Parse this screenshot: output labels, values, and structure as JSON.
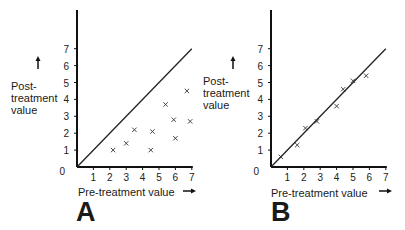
{
  "chart_data": [
    {
      "type": "scatter",
      "panel_label": "A",
      "title": "",
      "xlabel": "Pre-treatment value",
      "ylabel": "Post-treatment value",
      "xlim": [
        0,
        7
      ],
      "ylim": [
        0,
        7
      ],
      "x_ticks": [
        1,
        2,
        3,
        4,
        5,
        6,
        7
      ],
      "y_ticks": [
        0,
        1,
        2,
        3,
        4,
        5,
        6,
        7
      ],
      "grid": false,
      "reference_line": {
        "label": "line of identity",
        "from": [
          0,
          0
        ],
        "to": [
          7,
          7
        ]
      },
      "series": [
        {
          "name": "patients",
          "marker": "x",
          "x": [
            2.2,
            3.0,
            3.5,
            4.5,
            4.6,
            5.4,
            5.9,
            6.0,
            6.7,
            6.9
          ],
          "y": [
            1.0,
            1.4,
            2.2,
            1.0,
            2.1,
            3.7,
            2.8,
            1.7,
            4.5,
            2.7
          ]
        }
      ]
    },
    {
      "type": "scatter",
      "panel_label": "B",
      "title": "",
      "xlabel": "Pre-treatment value",
      "ylabel": "Post-treatment value",
      "xlim": [
        0,
        7
      ],
      "ylim": [
        0,
        7
      ],
      "x_ticks": [
        1,
        2,
        3,
        4,
        5,
        6,
        7
      ],
      "y_ticks": [
        0,
        1,
        2,
        3,
        4,
        5,
        6,
        7
      ],
      "grid": false,
      "reference_line": {
        "label": "line of identity",
        "from": [
          0,
          0
        ],
        "to": [
          7,
          7
        ]
      },
      "series": [
        {
          "name": "patients",
          "marker": "x",
          "x": [
            0.6,
            1.6,
            2.1,
            2.8,
            4.0,
            4.4,
            5.0,
            5.8
          ],
          "y": [
            0.6,
            1.3,
            2.3,
            2.7,
            3.6,
            4.6,
            5.1,
            5.4
          ]
        }
      ]
    }
  ],
  "panels": {
    "A": {
      "letter": "A",
      "ylabel_lines": [
        "Post-",
        "treatment",
        "value"
      ],
      "xlabel": "Pre-treatment value",
      "origin_label": "0"
    },
    "B": {
      "letter": "B",
      "ylabel_lines": [
        "Post-",
        "treatment",
        "value"
      ],
      "xlabel": "Pre-treatment value",
      "origin_label": "0"
    }
  }
}
